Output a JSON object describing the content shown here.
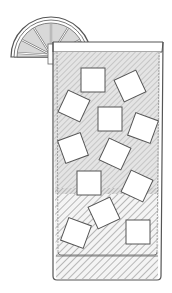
{
  "illustration": {
    "subject": "cocktail-glass-with-ice-and-lemon",
    "colors": {
      "background": "#ffffff",
      "outline": "#555555",
      "liquid_upper": "#e2e2e2",
      "liquid_lower": "#f2f2f2",
      "hatch": "#9a9a9a",
      "lemon_fill": "#dcdcdc",
      "ice": "#ffffff"
    },
    "ice_cube_count": 12
  }
}
